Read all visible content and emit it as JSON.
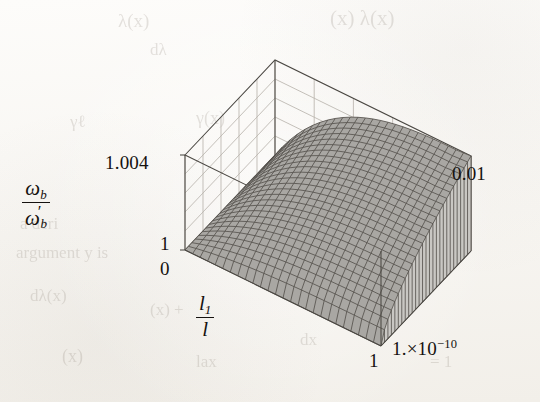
{
  "figure": {
    "kind": "3d-surface-plot",
    "medium": "scanned-book-page",
    "background_color": "#f7f5f1",
    "surface_color": "#a9a7a3",
    "mesh_color": "#53504b",
    "box_color": "#4a4742",
    "grid_color": "#b9b5ad"
  },
  "axes": {
    "vertical": {
      "name": "vertical-axis",
      "title_numerator": "ω",
      "title_numerator_sub": "b",
      "title_denominator": "ω",
      "title_denominator_sub": "b",
      "title_denominator_prime": "′",
      "ticks": [
        "1.004",
        "1"
      ],
      "tick_top": "1.004",
      "tick_bottom": "1",
      "range": [
        1.0,
        1.004
      ]
    },
    "horizontal": {
      "name": "horizontal-axis",
      "title_numerator": "l",
      "title_numerator_sub": "1",
      "title_denominator": "l",
      "ticks": [
        "0",
        "1"
      ],
      "tick_start": "0",
      "tick_end": "1",
      "range": [
        0,
        1
      ]
    },
    "depth": {
      "name": "depth-axis",
      "ticks": [
        "1.×10",
        "0.01"
      ],
      "tick_near_mantissa": "1.×10",
      "tick_near_exponent": "−10",
      "tick_far": "0.01",
      "range": [
        1e-10,
        0.01
      ]
    }
  },
  "ghost_text": [
    {
      "text": "(x) λ(x)",
      "x": 330,
      "y": 6,
      "size": 21
    },
    {
      "text": "λ(x)",
      "x": 118,
      "y": 10,
      "size": 19
    },
    {
      "text": "dλ",
      "x": 150,
      "y": 40,
      "size": 17
    },
    {
      "text": "γ(x)",
      "x": 196,
      "y": 108,
      "size": 18
    },
    {
      "text": "γℓ",
      "x": 70,
      "y": 112,
      "size": 17
    },
    {
      "text": "band",
      "x": 392,
      "y": 230,
      "size": 18
    },
    {
      "text": "sion",
      "x": 404,
      "y": 256,
      "size": 18
    },
    {
      "text": "a deri",
      "x": 20,
      "y": 214,
      "size": 17
    },
    {
      "text": "argument y is",
      "x": 16,
      "y": 243,
      "size": 17
    },
    {
      "text": "dλ(x)",
      "x": 30,
      "y": 286,
      "size": 17
    },
    {
      "text": "(x) +",
      "x": 150,
      "y": 300,
      "size": 17
    },
    {
      "text": "dx",
      "x": 300,
      "y": 330,
      "size": 17
    },
    {
      "text": "(x)",
      "x": 62,
      "y": 346,
      "size": 18
    },
    {
      "text": "lax",
      "x": 196,
      "y": 352,
      "size": 17
    },
    {
      "text": "= 1",
      "x": 430,
      "y": 352,
      "size": 17
    }
  ],
  "chart_data": {
    "type": "surface",
    "title": "",
    "xlabel": "l_1 / l",
    "ylabel": "omega_b / omega_b_prime",
    "zlabel": "1.e-10 ... 0.01",
    "xlim": [
      0,
      1
    ],
    "ylim": [
      1.0,
      1.004
    ],
    "zlim": [
      1e-10,
      0.01
    ],
    "grid": true,
    "legend": "none",
    "nx": 26,
    "nz": 26,
    "values_note": "z(u,v) normalized 0..1 over the vertical range 1.000..1.004",
    "surface_model": {
      "form": "z = (1 - exp(-k*u)) * (v^p) blended with a crest ridge",
      "k": 3.1,
      "p": 0.62,
      "crest_u": 0.78
    },
    "corner_values": {
      "front_left_x0_z0": 1.0,
      "front_right_x1_z0": 1.0005,
      "back_left_x0_zmax": 1.0012,
      "back_right_x1_zmax": 1.0038,
      "ridge_peak": 1.004
    }
  }
}
